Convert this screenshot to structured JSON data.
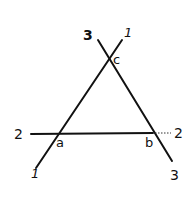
{
  "diagram": {
    "stroke_color": "#111111",
    "background": "#ffffff",
    "vertices": [
      {
        "id": "a",
        "label": "a"
      },
      {
        "id": "b",
        "label": "b"
      },
      {
        "id": "c",
        "label": "c"
      }
    ],
    "lines": [
      {
        "id": "line-1",
        "label_start": "1",
        "label_end": "1"
      },
      {
        "id": "line-2",
        "label_start": "2",
        "label_end": "2"
      },
      {
        "id": "line-3",
        "label_start": "3",
        "label_end": "3"
      }
    ]
  }
}
